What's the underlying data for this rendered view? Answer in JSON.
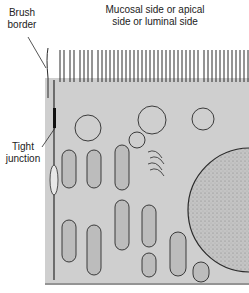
{
  "figure": {
    "labels": {
      "brush_border": "Brush border",
      "mucosal_side": "Mucosal side or apical side or luminal side",
      "tight_junction": "Tight junction"
    },
    "colors": {
      "cytoplasm": "#cfcfcf",
      "outline": "#2a2a2a",
      "nucleus": "#bdbdbd",
      "background": "#ffffff"
    }
  }
}
